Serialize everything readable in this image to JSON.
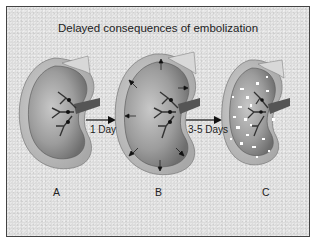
{
  "figure": {
    "title": "Delayed consequences of embolization",
    "arrows": [
      {
        "label": "1 Day"
      },
      {
        "label": "3-5 Days"
      }
    ],
    "stages": [
      {
        "label": "A",
        "description": "normal kidney with vascular tree and emboli"
      },
      {
        "label": "B",
        "description": "swollen kidney with outward pressure arrows"
      },
      {
        "label": "C",
        "description": "kidney with white necrotic spots"
      }
    ],
    "colors": {
      "background": "#dcdcdc",
      "kidney": "#9a9a9a",
      "capsule": "#c4c4c4",
      "vessels": "#333333",
      "border": "#444444"
    }
  }
}
